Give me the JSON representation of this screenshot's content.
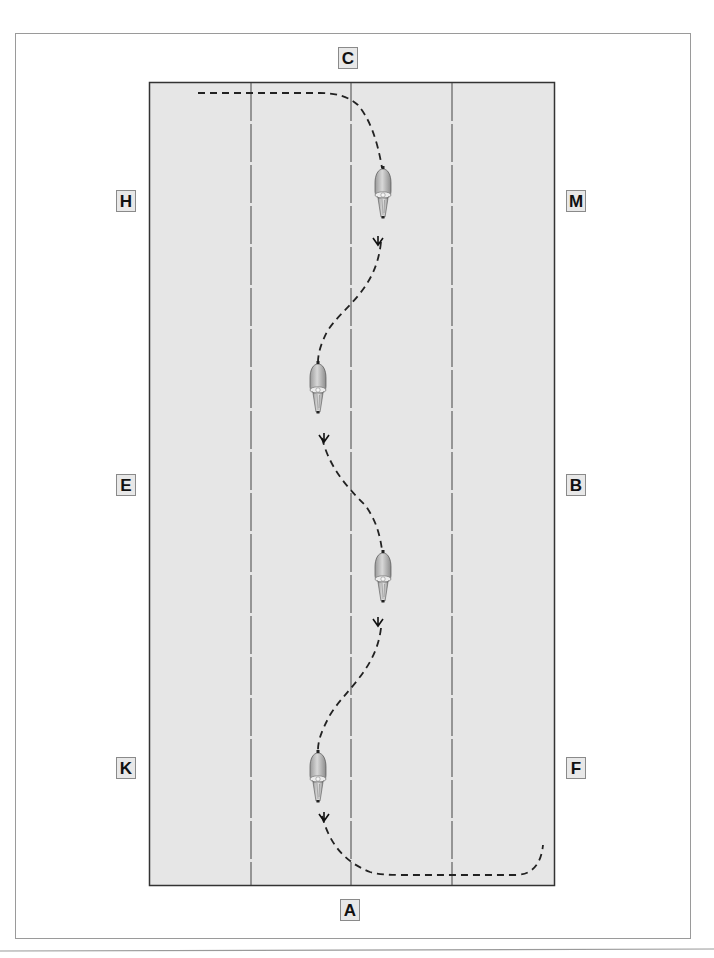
{
  "diagram": {
    "type": "dressage-arena-serpentine",
    "colors": {
      "arena_fill": "#e6e6e6",
      "arena_border": "#333333",
      "frame_border": "#9a9a9a",
      "path": "#222222",
      "letter_box_fill": "#e8e8e8"
    },
    "markers": [
      {
        "id": "C",
        "label": "C",
        "position": "top-center"
      },
      {
        "id": "H",
        "label": "H",
        "position": "left-top"
      },
      {
        "id": "M",
        "label": "M",
        "position": "right-top"
      },
      {
        "id": "E",
        "label": "E",
        "position": "left-middle"
      },
      {
        "id": "B",
        "label": "B",
        "position": "right-middle"
      },
      {
        "id": "K",
        "label": "K",
        "position": "left-bottom"
      },
      {
        "id": "F",
        "label": "F",
        "position": "right-bottom"
      },
      {
        "id": "A",
        "label": "A",
        "position": "bottom-center"
      }
    ],
    "divider_lines": 3,
    "path": {
      "style": "dashed",
      "description": "Serpentine of four loops from C end to A end",
      "direction_arrows": 4
    },
    "riders": [
      {
        "index": 1,
        "facing": "down"
      },
      {
        "index": 2,
        "facing": "down"
      },
      {
        "index": 3,
        "facing": "down"
      },
      {
        "index": 4,
        "facing": "down"
      }
    ]
  }
}
